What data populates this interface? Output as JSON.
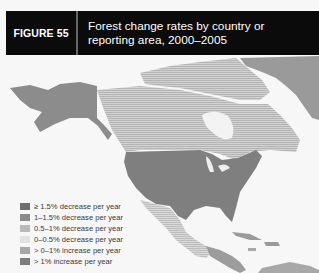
{
  "figure": {
    "label": "FIGURE 55",
    "title_line1": "Forest change rates by country or",
    "title_line2": "reporting area, 2000–2005"
  },
  "legend": {
    "items": [
      {
        "label": "≥ 1.5% decrease per year",
        "color": "#6e6e6e"
      },
      {
        "label": "1–1.5% decrease per year",
        "color": "#8a8a8a"
      },
      {
        "label": "0.5–1% decrease per year",
        "color": "#b9b9b9"
      },
      {
        "label": "0–0.5% decrease per year",
        "color": "#e2e2e2"
      },
      {
        "label": "> 0–1% increase per year",
        "color": "#a8a8a8"
      },
      {
        "label": "> 1% increase per year",
        "color": "#7d7d7d"
      }
    ]
  },
  "regions": [
    {
      "name": "Greenland",
      "class": "no-data-dark",
      "color": "#9a9a9a"
    },
    {
      "name": "Alaska (USA)",
      "class": "> 1% increase per year",
      "color": "#8c8c8c"
    },
    {
      "name": "Canada",
      "class": "0–0.5% decrease per year",
      "color": "#c4c4c4"
    },
    {
      "name": "United States",
      "class": "> 1% increase per year",
      "color": "#7f7f7f"
    },
    {
      "name": "Mexico",
      "class": "0.5–1% decrease per year",
      "color": "#c8c8c8"
    },
    {
      "name": "Central America",
      "class": "≥ 1.5% decrease per year",
      "color": "#9c9c9c"
    },
    {
      "name": "Caribbean",
      "class": "mixed",
      "color": "#9a9a9a"
    }
  ]
}
